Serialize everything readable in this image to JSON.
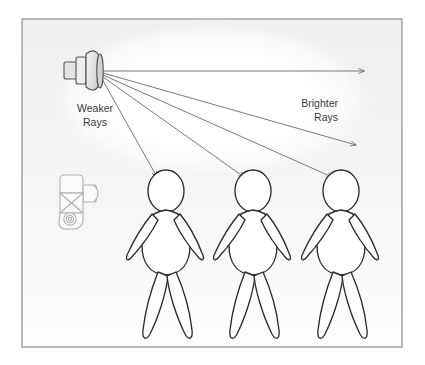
{
  "diagram": {
    "frame": {
      "x": 22,
      "y": 19,
      "width": 380,
      "height": 328,
      "border_color": "#8c8c8c",
      "background_color": "#f1f1f1"
    },
    "glow": {
      "name": "light-pool-ellipse",
      "color": "#ffffff",
      "cx": 212,
      "cy": 100,
      "rx": 168,
      "ry": 78
    },
    "labels": [
      {
        "id": "weaker-rays",
        "lines": [
          "Weaker",
          "Rays"
        ],
        "x": 95,
        "y": 108,
        "anchor": "middle",
        "color": "#3a3a3a"
      },
      {
        "id": "brighter-rays",
        "lines": [
          "Brighter",
          "Rays"
        ],
        "x": 338,
        "y": 103,
        "anchor": "end",
        "color": "#3a3a3a"
      }
    ],
    "light_source": {
      "name": "studio-light-head",
      "origin_x": 100,
      "origin_y": 72,
      "body_color": "#e8e8e8",
      "outline_color": "#555555"
    },
    "camera": {
      "name": "camera-top-view",
      "x": 60,
      "y": 172,
      "width": 42,
      "height": 58,
      "outline_color": "#b2b2b2",
      "fill_color": "#fafafa"
    },
    "rays": [
      {
        "id": "ray-1",
        "label": "Brighter Rays",
        "x1": 100,
        "y1": 72,
        "x2": 365,
        "y2": 72,
        "intensity": "brightest"
      },
      {
        "id": "ray-2",
        "label": "Brighter Rays",
        "x1": 100,
        "y1": 72,
        "x2": 357,
        "y2": 145,
        "intensity": "bright"
      },
      {
        "id": "ray-3",
        "label": "",
        "x1": 100,
        "y1": 72,
        "x2": 333,
        "y2": 178,
        "intensity": "medium"
      },
      {
        "id": "ray-4",
        "label": "",
        "x1": 100,
        "y1": 72,
        "x2": 245,
        "y2": 178,
        "intensity": "medium"
      },
      {
        "id": "ray-5",
        "label": "Weaker Rays",
        "x1": 100,
        "y1": 72,
        "x2": 158,
        "y2": 178,
        "intensity": "weak"
      }
    ],
    "ray_color": "#6b6b6b",
    "figures": [
      {
        "id": "figure-1",
        "cx": 166,
        "label": "Subject nearest light fall-off"
      },
      {
        "id": "figure-2",
        "cx": 253,
        "label": "Subject middle"
      },
      {
        "id": "figure-3",
        "cx": 341,
        "label": "Subject farthest"
      }
    ],
    "figure_outline_color": "#2b2b2b",
    "figure_fill_color": "#ffffff"
  }
}
